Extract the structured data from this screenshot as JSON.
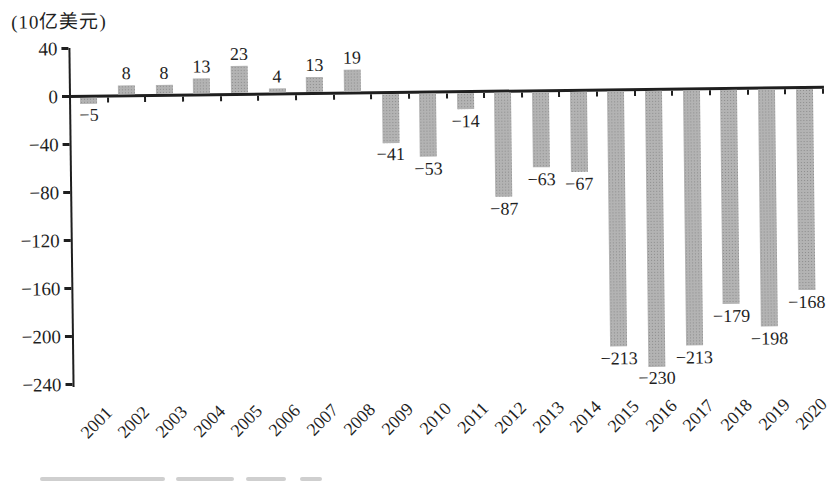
{
  "chart_data": {
    "type": "bar",
    "title": "",
    "unit_label": "(10亿美元)",
    "xlabel": "",
    "ylabel": "(10亿美元)",
    "categories": [
      "2001",
      "2002",
      "2003",
      "2004",
      "2005",
      "2006",
      "2007",
      "2008",
      "2009",
      "2010",
      "2011",
      "2012",
      "2013",
      "2014",
      "2015",
      "2016",
      "2017",
      "2018",
      "2019",
      "2020"
    ],
    "values": [
      -5,
      8,
      8,
      13,
      23,
      4,
      13,
      19,
      -41,
      -53,
      -14,
      -87,
      -63,
      -67,
      -213,
      -230,
      -213,
      -179,
      -198,
      -168
    ],
    "value_labels": [
      "−5",
      "8",
      "8",
      "13",
      "23",
      "4",
      "13",
      "19",
      "−41",
      "−53",
      "−14",
      "−87",
      "−63",
      "−67",
      "−213",
      "−230",
      "−213",
      "−179",
      "−198",
      "−168"
    ],
    "ylim": [
      -240,
      40
    ],
    "yticks": [
      40,
      0,
      -40,
      -80,
      -120,
      -160,
      -200,
      -240
    ],
    "ytick_labels": [
      "40",
      "0",
      "−40",
      "−80",
      "−120",
      "−160",
      "−200",
      "−240"
    ],
    "grid": false,
    "legend": "none",
    "data_labels": "all",
    "bar_color": "#b3b3b3",
    "axis_color": "#1f1f1f"
  }
}
